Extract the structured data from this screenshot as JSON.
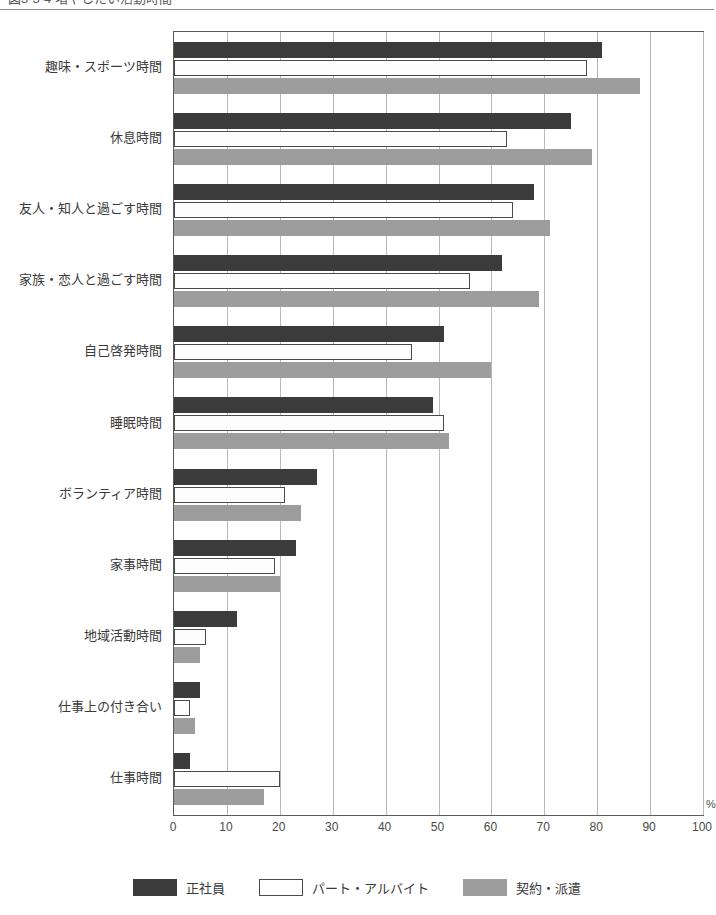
{
  "caption": {
    "text": "図3-3-4 増やしたい活動時間",
    "divider": "horizontal-rule"
  },
  "axis": {
    "unit_label": "%",
    "x_ticks": [
      "0",
      "10",
      "20",
      "30",
      "40",
      "50",
      "60",
      "70",
      "80",
      "90",
      "100"
    ]
  },
  "legend": {
    "items": [
      {
        "label": "正社員",
        "swatch": "dark-filled-swatch",
        "color": "#3b3b3b"
      },
      {
        "label": "パート・アルバイト",
        "swatch": "white-outlined-swatch",
        "color": "#ffffff"
      },
      {
        "label": "契約・派遣",
        "swatch": "gray-filled-swatch",
        "color": "#9d9d9d"
      }
    ]
  },
  "chart_data": {
    "type": "bar",
    "orientation": "horizontal",
    "title": "図3-3-4 増やしたい活動時間",
    "xlabel": "%",
    "ylabel": "",
    "xlim": [
      0,
      100
    ],
    "grid": true,
    "legend_position": "bottom",
    "categories": [
      "趣味・スポーツ時間",
      "休息時間",
      "友人・知人と過ごす時間",
      "家族・恋人と過ごす時間",
      "自己啓発時間",
      "睡眠時間",
      "ボランティア時間",
      "家事時間",
      "地域活動時間",
      "仕事上の付き合い",
      "仕事時間"
    ],
    "series": [
      {
        "name": "正社員",
        "color": "#3b3b3b",
        "values": [
          81,
          75,
          68,
          62,
          51,
          49,
          27,
          23,
          12,
          5,
          3
        ]
      },
      {
        "name": "パート・アルバイト",
        "color": "#ffffff",
        "values": [
          78,
          63,
          64,
          56,
          45,
          51,
          21,
          19,
          6,
          3,
          20
        ]
      },
      {
        "name": "契約・派遣",
        "color": "#9d9d9d",
        "values": [
          88,
          79,
          71,
          69,
          60,
          52,
          24,
          20,
          5,
          4,
          17
        ]
      }
    ]
  }
}
